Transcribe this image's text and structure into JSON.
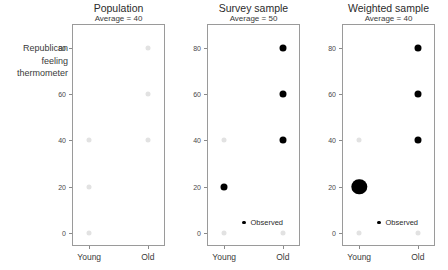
{
  "chart_data": {
    "type": "scatter",
    "title": "",
    "ylabel_lines": [
      "Republican",
      "feeling",
      "thermometer"
    ],
    "xlabel": "",
    "categories": [
      "Young",
      "Old"
    ],
    "ylim": [
      0,
      85
    ],
    "yticks": [
      0,
      20,
      40,
      60,
      80
    ],
    "ytick_labels": [
      "0",
      "20",
      "40",
      "60",
      "80"
    ],
    "grid": false,
    "legend_label": "Observed",
    "legend_position": "bottom-right inside panel",
    "colors": {
      "population_dot": "#e2e2e2",
      "observed_dot": "#000000",
      "axis": "#9a9a9a",
      "text": "#2b2b2b"
    },
    "panels": [
      {
        "title": "Population",
        "subtitle": "Average = 40",
        "average": 40,
        "has_legend": false,
        "population_points": [
          {
            "x": "Young",
            "y": 0
          },
          {
            "x": "Young",
            "y": 20
          },
          {
            "x": "Young",
            "y": 40
          },
          {
            "x": "Old",
            "y": 40
          },
          {
            "x": "Old",
            "y": 60
          },
          {
            "x": "Old",
            "y": 80
          }
        ],
        "observed_points": []
      },
      {
        "title": "Survey sample",
        "subtitle": "Average = 50",
        "average": 50,
        "has_legend": true,
        "population_points": [
          {
            "x": "Young",
            "y": 0
          },
          {
            "x": "Young",
            "y": 40
          },
          {
            "x": "Old",
            "y": 0
          }
        ],
        "observed_points": [
          {
            "x": "Young",
            "y": 20,
            "weight": 1
          },
          {
            "x": "Old",
            "y": 40,
            "weight": 1
          },
          {
            "x": "Old",
            "y": 60,
            "weight": 1
          },
          {
            "x": "Old",
            "y": 80,
            "weight": 1
          }
        ]
      },
      {
        "title": "Weighted sample",
        "subtitle": "Average = 40",
        "average": 40,
        "has_legend": true,
        "population_points": [
          {
            "x": "Young",
            "y": 0
          },
          {
            "x": "Young",
            "y": 40
          },
          {
            "x": "Old",
            "y": 0
          }
        ],
        "observed_points": [
          {
            "x": "Young",
            "y": 20,
            "weight": 3
          },
          {
            "x": "Old",
            "y": 40,
            "weight": 1
          },
          {
            "x": "Old",
            "y": 60,
            "weight": 1
          },
          {
            "x": "Old",
            "y": 80,
            "weight": 1
          }
        ]
      }
    ]
  }
}
